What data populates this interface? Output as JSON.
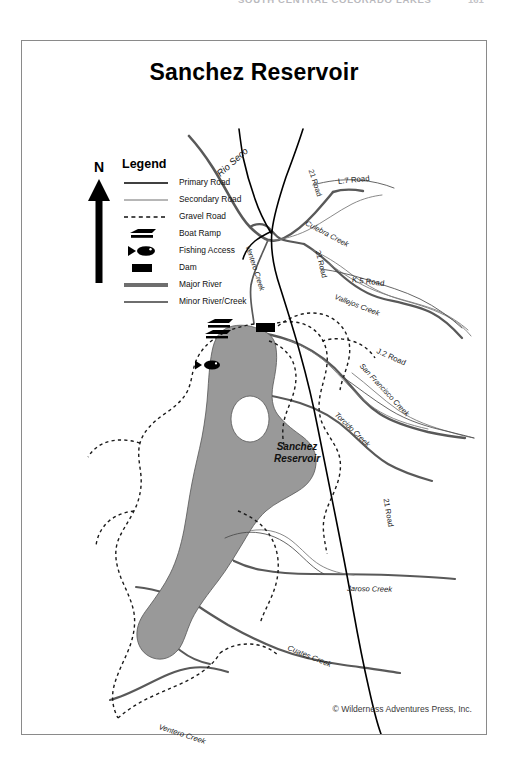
{
  "running_header": {
    "title": "SOUTH CENTRAL COLORADO LAKES",
    "page_number": "161"
  },
  "map": {
    "title": "Sanchez Reservoir",
    "copyright": "© Wilderness Adventures Press, Inc.",
    "reservoir_label_line1": "Sanchez",
    "reservoir_label_line2": "Reservoir",
    "water_color": "#999999",
    "frame_color": "#8a8a8a",
    "road_color": "#000000",
    "river_color": "#595959"
  },
  "north_arrow": {
    "letter": "N"
  },
  "legend": {
    "title": "Legend",
    "items": [
      {
        "icon": "primary-road-line",
        "label": "Primary Road"
      },
      {
        "icon": "secondary-road-line",
        "label": "Secondary Road"
      },
      {
        "icon": "gravel-road-dashed-line",
        "label": "Gravel Road"
      },
      {
        "icon": "boat-ramp-icon",
        "label": "Boat Ramp"
      },
      {
        "icon": "fishing-access-fish-icon",
        "label": "Fishing Access"
      },
      {
        "icon": "dam-bar-icon",
        "label": "Dam"
      },
      {
        "icon": "major-river-line",
        "label": "Major River"
      },
      {
        "icon": "minor-river-line",
        "label": "Minor River/Creek"
      }
    ]
  },
  "map_labels": [
    {
      "name": "rio-seco",
      "text": "Rio Seco",
      "x": 196,
      "y": 128,
      "rotate": -42,
      "size": 9.4,
      "italic": true
    },
    {
      "name": "ventero-creek-north",
      "text": "Ventero Creek",
      "x": 226,
      "y": 200,
      "rotate": 72,
      "size": 7.4,
      "italic": true
    },
    {
      "name": "road-21-north",
      "text": "21 Road",
      "x": 289,
      "y": 124,
      "rotate": 72,
      "size": 7.4,
      "italic": false
    },
    {
      "name": "l7-road",
      "text": "L.7 Road",
      "x": 316,
      "y": 136,
      "rotate": -6,
      "size": 7.8,
      "italic": false
    },
    {
      "name": "culebra-creek",
      "text": "Culebra Creek",
      "x": 284,
      "y": 177,
      "rotate": 28,
      "size": 7.4,
      "italic": true
    },
    {
      "name": "road-21-mid",
      "text": "21 Road",
      "x": 296,
      "y": 205,
      "rotate": 76,
      "size": 7.4,
      "italic": false
    },
    {
      "name": "k5-road",
      "text": "K.5 Road",
      "x": 330,
      "y": 234,
      "rotate": 7,
      "size": 7.8,
      "italic": false
    },
    {
      "name": "vallejos-creek",
      "text": "Vallejos Creek",
      "x": 313,
      "y": 251,
      "rotate": 21,
      "size": 7.4,
      "italic": true
    },
    {
      "name": "j2-road",
      "text": "J.2 Road",
      "x": 355,
      "y": 305,
      "rotate": 24,
      "size": 7.8,
      "italic": false
    },
    {
      "name": "san-francisco-creek",
      "text": "San Francisco Creek",
      "x": 339,
      "y": 319,
      "rotate": 47,
      "size": 7.4,
      "italic": true
    },
    {
      "name": "torcido-creek",
      "text": "Torcido Creek",
      "x": 314,
      "y": 368,
      "rotate": 44,
      "size": 7.4,
      "italic": true
    },
    {
      "name": "road-21-south",
      "text": "21 Road",
      "x": 364,
      "y": 453,
      "rotate": 80,
      "size": 7.6,
      "italic": false
    },
    {
      "name": "jaroso-creek",
      "text": "Jaroso Creek",
      "x": 325,
      "y": 543,
      "rotate": 1,
      "size": 7.6,
      "italic": true
    },
    {
      "name": "cuates-creek",
      "text": "Cuates Creek",
      "x": 266,
      "y": 602,
      "rotate": 22,
      "size": 7.6,
      "italic": true
    },
    {
      "name": "ventero-creek-south",
      "text": "Ventero Creek",
      "x": 137,
      "y": 681,
      "rotate": 18,
      "size": 7.6,
      "italic": true
    }
  ]
}
